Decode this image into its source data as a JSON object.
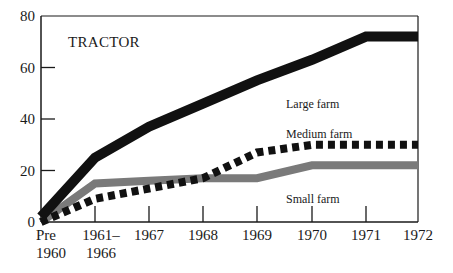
{
  "chart_data": {
    "type": "line",
    "title": "TRACTOR",
    "xlabel": "",
    "ylabel": "",
    "categories": [
      "Pre 1960",
      "1961–1966",
      "1967",
      "1968",
      "1969",
      "1970",
      "1971",
      "1972"
    ],
    "x_tick_labels": [
      {
        "line1": "Pre",
        "line2": "1960"
      },
      {
        "line1": "1961–",
        "line2": "1966"
      },
      {
        "line1": "1967",
        "line2": ""
      },
      {
        "line1": "1968",
        "line2": ""
      },
      {
        "line1": "1969",
        "line2": ""
      },
      {
        "line1": "1970",
        "line2": ""
      },
      {
        "line1": "1971",
        "line2": ""
      },
      {
        "line1": "1972",
        "line2": ""
      }
    ],
    "y_ticks": [
      0,
      20,
      40,
      60,
      80
    ],
    "ylim": [
      0,
      80
    ],
    "grid": false,
    "legend_position": "inline labels",
    "series": [
      {
        "name": "Large farm",
        "style": "solid-black-thick",
        "color": "#111111",
        "values": [
          2,
          25,
          37,
          46,
          55,
          63,
          72,
          72
        ]
      },
      {
        "name": "Medium farm",
        "style": "dotted-black",
        "color": "#111111",
        "values": [
          0,
          9,
          13,
          17,
          27,
          30,
          30,
          30
        ]
      },
      {
        "name": "Small farm",
        "style": "solid-gray",
        "color": "#777777",
        "values": [
          0,
          15,
          16,
          17,
          17,
          22,
          22,
          22
        ]
      }
    ]
  }
}
